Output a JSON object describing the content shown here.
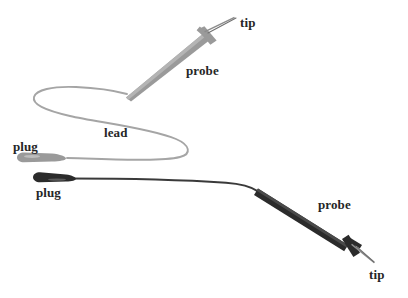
{
  "figure": {
    "kind": "line-diagram",
    "background_color": "#ffffff",
    "width": 408,
    "height": 298
  },
  "colors": {
    "gray_assembly": "#9a9a9a",
    "gray_assembly_light": "#b0b0b0",
    "dark_assembly": "#2b2b2b",
    "lead_gray": "#a5a5a5",
    "lead_dark": "#3a3a3a",
    "tip_line": "#8c8c8c",
    "label_text": "#262626"
  },
  "labels": [
    {
      "id": "tip-upper",
      "text": "tip",
      "x": 240,
      "y": 16
    },
    {
      "id": "probe-upper",
      "text": "probe",
      "x": 186,
      "y": 64
    },
    {
      "id": "lead",
      "text": "lead",
      "x": 104,
      "y": 126
    },
    {
      "id": "plug-upper",
      "text": "plug",
      "x": 13,
      "y": 140
    },
    {
      "id": "plug-lower",
      "text": "plug",
      "x": 36,
      "y": 186
    },
    {
      "id": "probe-lower",
      "text": "probe",
      "x": 318,
      "y": 198
    },
    {
      "id": "tip-lower",
      "text": "tip",
      "x": 369,
      "y": 268
    }
  ],
  "assemblies": [
    {
      "id": "upper-assembly",
      "tone": "gray",
      "parts": [
        "plug",
        "lead",
        "probe",
        "tip"
      ]
    },
    {
      "id": "lower-assembly",
      "tone": "dark",
      "parts": [
        "plug",
        "lead",
        "probe",
        "tip"
      ]
    }
  ],
  "leader_lines": [
    {
      "id": "tip-upper-leader",
      "from": [
        208,
        33
      ],
      "to": [
        236,
        18
      ]
    },
    {
      "id": "tip-lower-leader",
      "from": [
        357,
        247
      ],
      "to": [
        374,
        262
      ]
    }
  ]
}
